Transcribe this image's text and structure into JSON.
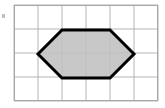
{
  "figure": {
    "canvas": {
      "width": 165,
      "height": 108,
      "background": "#ffffff"
    },
    "grid": {
      "name": "square-grid",
      "origin_x": 14,
      "origin_y": 5,
      "cell_size": 24,
      "columns": 6,
      "rows": 4,
      "width": 144,
      "height": 96,
      "line_color": "#b4b4b4",
      "line_width": 1,
      "border_color": "#a8a8a8",
      "border_width": 1,
      "vertical_lines": [
        14,
        38,
        62,
        86,
        110,
        134,
        158
      ],
      "horizontal_lines": [
        5,
        29,
        53,
        77,
        101
      ]
    },
    "shape": {
      "name": "hexagon",
      "sides": 6,
      "fill": "#c0c0c0",
      "stroke": "#000000",
      "stroke_width": 3,
      "points": "38,54 62,30 110,30 134,54 110,78 62,78",
      "vertices": [
        {
          "label": "left",
          "x": 38,
          "y": 54
        },
        {
          "label": "top-left",
          "x": 62,
          "y": 30
        },
        {
          "label": "top-right",
          "x": 110,
          "y": 30
        },
        {
          "label": "right",
          "x": 134,
          "y": 54
        },
        {
          "label": "bottom-right",
          "x": 110,
          "y": 78
        },
        {
          "label": "bottom-left",
          "x": 62,
          "y": 78
        }
      ]
    },
    "edge_mark": {
      "name": "left-edge-mark",
      "x": 2,
      "y": 14,
      "width": 3,
      "height": 4,
      "color": "#8c8c8c"
    }
  }
}
